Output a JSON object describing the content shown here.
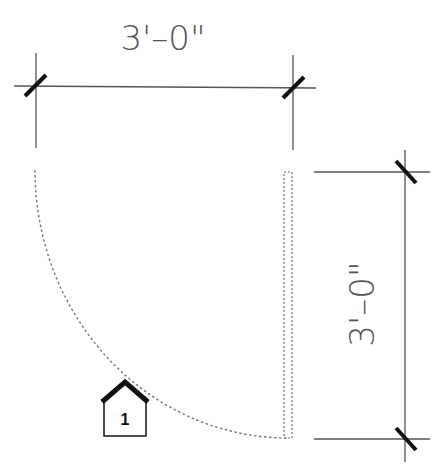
{
  "drawing": {
    "type": "door plan - swing",
    "width_dimension": "3'–0\"",
    "height_dimension": "3'–0\"",
    "door_tag": "1",
    "colors": {
      "line": "#555555",
      "tick": "#111111",
      "dashed": "#777777",
      "background": "#ffffff"
    }
  }
}
